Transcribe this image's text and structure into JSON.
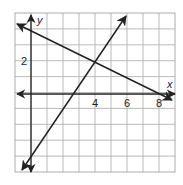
{
  "chart_data": {
    "type": "line",
    "title": "",
    "xlabel": "x",
    "ylabel": "y",
    "xlim": [
      -1,
      9
    ],
    "ylim": [
      -5,
      5
    ],
    "grid": true,
    "x_tick_labels": [
      "4",
      "6",
      "8"
    ],
    "y_tick_labels": [
      "2"
    ],
    "series": [
      {
        "name": "line-1",
        "equation": "y = -0.5x + 4",
        "points": [
          [
            -1,
            4.5
          ],
          [
            8.8,
            -0.4
          ]
        ]
      },
      {
        "name": "line-2",
        "equation": "y = 2x - 6",
        "points": [
          [
            -0.6,
            -7.2
          ],
          [
            5.9,
            5.8
          ]
        ]
      }
    ],
    "intersection": [
      4,
      2
    ]
  },
  "labels": {
    "x_axis": "x",
    "y_axis": "y",
    "t4": "4",
    "t6": "6",
    "t8": "8",
    "t2": "2"
  }
}
